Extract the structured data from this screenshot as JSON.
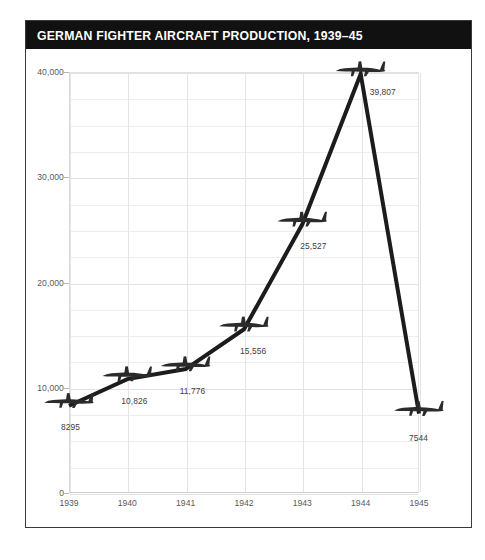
{
  "chart_data": {
    "type": "line",
    "title": "GERMAN FIGHTER AIRCRAFT PRODUCTION, 1939–45",
    "xlabel": "",
    "ylabel": "",
    "categories": [
      "1939",
      "1940",
      "1941",
      "1942",
      "1943",
      "1944",
      "1945"
    ],
    "x": [
      1939,
      1940,
      1941,
      1942,
      1943,
      1944,
      1945
    ],
    "values": [
      8295,
      10826,
      11776,
      15556,
      25527,
      39807,
      7544
    ],
    "point_labels": [
      "8295",
      "10,826",
      "11,776",
      "15,556",
      "25,527",
      "39,807",
      "7544"
    ],
    "ylim": [
      0,
      40000
    ],
    "ytick_values": [
      0,
      10000,
      20000,
      30000,
      40000
    ],
    "ytick_labels": [
      "0",
      "10,000",
      "20,000",
      "30,000",
      "40,000"
    ],
    "minor_gridline_step": 2500,
    "grid": true,
    "legend": "none",
    "marker": "aircraft-silhouette",
    "line_color": "#1c1c1c",
    "grid_color": "#ededed",
    "title_background": "#111111",
    "title_color": "#ffffff"
  },
  "figure": {
    "border_color": "#3a3a3a",
    "background": "#ffffff"
  }
}
